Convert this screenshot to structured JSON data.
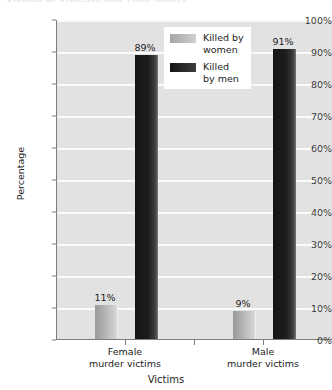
{
  "chart_data": {
    "type": "bar",
    "title": "Victims of Violence and Their Killers",
    "xlabel": "Victims",
    "ylabel": "Percentage",
    "categories": [
      "Female\nmurder victims",
      "Male\nmurder victims"
    ],
    "series": [
      {
        "name": "Killed by\nwomen",
        "values": [
          11,
          9
        ],
        "color": "#b4b4b4"
      },
      {
        "name": "Killed\nby men",
        "values": [
          89,
          91
        ],
        "color": "#1a1a1a"
      }
    ],
    "value_labels": [
      "11%",
      "89%",
      "9%",
      "91%"
    ],
    "ylim": [
      0,
      100
    ],
    "ytick_values": [
      0,
      10,
      20,
      30,
      40,
      50,
      60,
      70,
      80,
      90,
      100
    ],
    "ytick_labels": [
      "0%",
      "10%",
      "20%",
      "30%",
      "40%",
      "50%",
      "60%",
      "70%",
      "80%",
      "90%",
      "100%"
    ],
    "grid": true,
    "legend_position": "upper-center",
    "plot_background": "#e2e2e2",
    "gridline_color": "#fbfbfb",
    "axis_color": "#7d7d7d"
  },
  "axes": {
    "y_label": "Percentage",
    "x_label": "Victims",
    "y_ticks": [
      "100%",
      "90%",
      "80%",
      "70%",
      "60%",
      "50%",
      "40%",
      "30%",
      "20%",
      "10%",
      "0%"
    ],
    "x_categories": [
      {
        "line1": "Female",
        "line2": "murder victims"
      },
      {
        "line1": "Male",
        "line2": "murder victims"
      }
    ]
  },
  "legend": {
    "items": [
      {
        "label": "Killed by\nwomen",
        "color": "#b4b4b4"
      },
      {
        "label": "Killed\nby men",
        "color": "#1a1a1a"
      }
    ]
  },
  "bars": [
    {
      "group": "Female murder victims",
      "series": "Killed by women",
      "value": 11,
      "label": "11%"
    },
    {
      "group": "Female murder victims",
      "series": "Killed by men",
      "value": 89,
      "label": "89%"
    },
    {
      "group": "Male murder victims",
      "series": "Killed by women",
      "value": 9,
      "label": "9%"
    },
    {
      "group": "Male murder victims",
      "series": "Killed by men",
      "value": 91,
      "label": "91%"
    }
  ],
  "title": "Victims of Violence and Their Killers"
}
